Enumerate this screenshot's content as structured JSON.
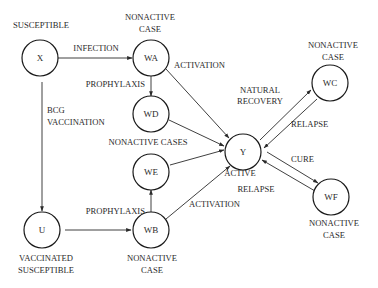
{
  "diagram": {
    "type": "state-transition",
    "nodes": [
      {
        "id": "X",
        "label": "X",
        "caption": [
          "SUSCEPTIBLE"
        ]
      },
      {
        "id": "WA",
        "label": "WA",
        "caption": [
          "NONACTIVE",
          "CASE"
        ]
      },
      {
        "id": "WD",
        "label": "WD",
        "caption": []
      },
      {
        "id": "WE",
        "label": "WE",
        "caption": []
      },
      {
        "id": "WB",
        "label": "WB",
        "caption": [
          "NONACTIVE",
          "CASE"
        ]
      },
      {
        "id": "U",
        "label": "U",
        "caption": [
          "VACCINATED",
          "SUSCEPTIBLE"
        ]
      },
      {
        "id": "Y",
        "label": "Y",
        "caption": [
          "ACTIVE"
        ]
      },
      {
        "id": "WC",
        "label": "WC",
        "caption": [
          "NONACTIVE",
          "CASE"
        ]
      },
      {
        "id": "WF",
        "label": "WF",
        "caption": [
          "NONACTIVE",
          "CASE"
        ]
      }
    ],
    "group_caption": "NONACTIVE CASES",
    "edges": [
      {
        "from": "X",
        "to": "WA",
        "label": "INFECTION"
      },
      {
        "from": "WA",
        "to": "WD",
        "label": "PROPHYLAXIS"
      },
      {
        "from": "WA",
        "to": "Y",
        "label": "ACTIVATION"
      },
      {
        "from": "WD",
        "to": "Y",
        "label": ""
      },
      {
        "from": "X",
        "to": "U",
        "label": "BCG VACCINATION"
      },
      {
        "from": "U",
        "to": "WB",
        "label": ""
      },
      {
        "from": "WB",
        "to": "WE",
        "label": "PROPHYLAXIS"
      },
      {
        "from": "WE",
        "to": "Y",
        "label": ""
      },
      {
        "from": "WB",
        "to": "Y",
        "label": "ACTIVATION"
      },
      {
        "from": "Y",
        "to": "WC",
        "label": "NATURAL RECOVERY"
      },
      {
        "from": "WC",
        "to": "Y",
        "label": "RELAPSE"
      },
      {
        "from": "Y",
        "to": "WF",
        "label": "CURE"
      },
      {
        "from": "WF",
        "to": "Y",
        "label": "RELAPSE"
      }
    ]
  },
  "labels": {
    "susceptible": "SUSCEPTIBLE",
    "wa_cap1": "NONACTIVE",
    "wa_cap2": "CASE",
    "infection": "INFECTION",
    "activation_top": "ACTIVATION",
    "prophylaxis_top": "PROPHYLAXIS",
    "bcg1": "BCG",
    "bcg2": "VACCINATION",
    "nonactive_cases": "NONACTIVE CASES",
    "natural1": "NATURAL",
    "natural2": "RECOVERY",
    "wc_cap1": "NONACTIVE",
    "wc_cap2": "CASE",
    "relapse_top": "RELAPSE",
    "active": "ACTIVE",
    "cure": "CURE",
    "relapse_bottom": "RELAPSE",
    "prophylaxis_bottom": "PROPHYLAXIS",
    "activation_bottom": "ACTIVATION",
    "wf_cap1": "NONACTIVE",
    "wf_cap2": "CASE",
    "u_cap1": "VACCINATED",
    "u_cap2": "SUSCEPTIBLE",
    "wb_cap1": "NONACTIVE",
    "wb_cap2": "CASE",
    "X": "X",
    "WA": "WA",
    "WD": "WD",
    "WE": "WE",
    "WB": "WB",
    "U": "U",
    "Y": "Y",
    "WC": "WC",
    "WF": "WF"
  }
}
